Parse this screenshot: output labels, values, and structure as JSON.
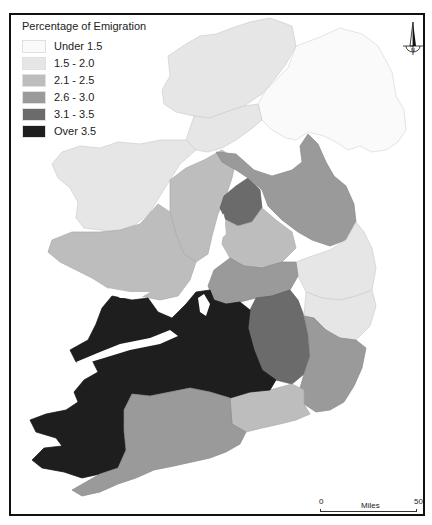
{
  "legend": {
    "title": "Percentage of Emigration",
    "items": [
      {
        "label": "Under 1.5",
        "color": "#fafafa"
      },
      {
        "label": "1.5 - 2.0",
        "color": "#e6e6e6"
      },
      {
        "label": "2.1 - 2.5",
        "color": "#bdbdbd"
      },
      {
        "label": "2.6 - 3.0",
        "color": "#9a9a9a"
      },
      {
        "label": "3.1 - 3.5",
        "color": "#6b6b6b"
      },
      {
        "label": "Over 3.5",
        "color": "#1e1e1e"
      }
    ]
  },
  "north_arrow": {
    "label": "N"
  },
  "scale_bar": {
    "start": "0",
    "end": "50",
    "unit": "Miles"
  },
  "map": {
    "subject": "Ireland",
    "classes": {
      "under_1_5": "#fafafa",
      "c1_5_2_0": "#e6e6e6",
      "c2_1_2_5": "#bdbdbd",
      "c2_6_3_0": "#9a9a9a",
      "c3_1_3_5": "#6b6b6b",
      "over_3_5": "#1e1e1e"
    }
  }
}
